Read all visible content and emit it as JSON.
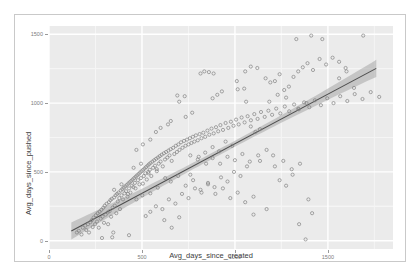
{
  "caption_ghost": "",
  "chart_data": {
    "type": "scatter",
    "title": "",
    "xlabel": "Avg_days_since_created",
    "ylabel": "Avg_days_since_pushed",
    "xlim": [
      0,
      1850
    ],
    "ylim": [
      -60,
      1560
    ],
    "xticks": [
      0,
      500,
      1000,
      1500
    ],
    "yticks": [
      0,
      500,
      1000,
      1500
    ],
    "xtick_labels": [
      "0",
      "500",
      "1000",
      "1500"
    ],
    "ytick_labels": [
      "0",
      "500",
      "1000",
      "1500"
    ],
    "grid": true,
    "legend": "none",
    "panel_background": "#ebebeb",
    "gridline_color": "#ffffff",
    "point_color": "#7f7f7f",
    "point_fill": "none",
    "point_shape": "open-circle",
    "point_size": 3.2,
    "fit": {
      "type": "linear-regression",
      "line_color": "#4d4d4d",
      "band_color": "#a6a6a6",
      "band_opacity": 0.55,
      "slope": 0.72,
      "intercept": -15,
      "x_start": 120,
      "x_end": 1760,
      "band_halfwidth_min": 22,
      "band_halfwidth_end": 62
    },
    "points": [
      [
        150,
        60
      ],
      [
        160,
        72
      ],
      [
        175,
        45
      ],
      [
        182,
        95
      ],
      [
        195,
        110
      ],
      [
        200,
        78
      ],
      [
        210,
        120
      ],
      [
        215,
        60
      ],
      [
        222,
        135
      ],
      [
        230,
        150
      ],
      [
        235,
        100
      ],
      [
        240,
        168
      ],
      [
        248,
        120
      ],
      [
        252,
        185
      ],
      [
        258,
        140
      ],
      [
        262,
        200
      ],
      [
        268,
        95
      ],
      [
        272,
        210
      ],
      [
        278,
        160
      ],
      [
        282,
        225
      ],
      [
        288,
        175
      ],
      [
        292,
        240
      ],
      [
        296,
        130
      ],
      [
        300,
        255
      ],
      [
        305,
        190
      ],
      [
        310,
        268
      ],
      [
        315,
        205
      ],
      [
        318,
        120
      ],
      [
        322,
        280
      ],
      [
        326,
        215
      ],
      [
        330,
        295
      ],
      [
        334,
        175
      ],
      [
        338,
        305
      ],
      [
        342,
        240
      ],
      [
        346,
        60
      ],
      [
        350,
        315
      ],
      [
        354,
        255
      ],
      [
        358,
        330
      ],
      [
        362,
        200
      ],
      [
        366,
        340
      ],
      [
        370,
        285
      ],
      [
        374,
        350
      ],
      [
        378,
        310
      ],
      [
        382,
        230
      ],
      [
        386,
        365
      ],
      [
        390,
        330
      ],
      [
        394,
        375
      ],
      [
        398,
        300
      ],
      [
        402,
        385
      ],
      [
        406,
        345
      ],
      [
        410,
        395
      ],
      [
        414,
        360
      ],
      [
        418,
        405
      ],
      [
        422,
        320
      ],
      [
        426,
        415
      ],
      [
        430,
        380
      ],
      [
        434,
        425
      ],
      [
        438,
        350
      ],
      [
        442,
        435
      ],
      [
        446,
        400
      ],
      [
        450,
        445
      ],
      [
        454,
        390
      ],
      [
        458,
        455
      ],
      [
        462,
        420
      ],
      [
        466,
        465
      ],
      [
        470,
        300
      ],
      [
        474,
        475
      ],
      [
        478,
        440
      ],
      [
        482,
        485
      ],
      [
        486,
        410
      ],
      [
        490,
        495
      ],
      [
        494,
        455
      ],
      [
        498,
        505
      ],
      [
        502,
        330
      ],
      [
        506,
        515
      ],
      [
        510,
        470
      ],
      [
        514,
        525
      ],
      [
        518,
        490
      ],
      [
        522,
        535
      ],
      [
        526,
        445
      ],
      [
        530,
        545
      ],
      [
        534,
        500
      ],
      [
        538,
        555
      ],
      [
        542,
        515
      ],
      [
        546,
        565
      ],
      [
        550,
        470
      ],
      [
        556,
        575
      ],
      [
        560,
        530
      ],
      [
        566,
        585
      ],
      [
        570,
        545
      ],
      [
        576,
        595
      ],
      [
        580,
        505
      ],
      [
        586,
        605
      ],
      [
        590,
        560
      ],
      [
        596,
        615
      ],
      [
        600,
        575
      ],
      [
        606,
        625
      ],
      [
        612,
        540
      ],
      [
        618,
        635
      ],
      [
        624,
        590
      ],
      [
        630,
        645
      ],
      [
        636,
        605
      ],
      [
        642,
        655
      ],
      [
        648,
        620
      ],
      [
        654,
        665
      ],
      [
        660,
        580
      ],
      [
        668,
        675
      ],
      [
        674,
        630
      ],
      [
        682,
        690
      ],
      [
        688,
        645
      ],
      [
        696,
        700
      ],
      [
        702,
        660
      ],
      [
        710,
        715
      ],
      [
        718,
        675
      ],
      [
        726,
        725
      ],
      [
        734,
        690
      ],
      [
        742,
        735
      ],
      [
        750,
        700
      ],
      [
        758,
        745
      ],
      [
        766,
        710
      ],
      [
        774,
        755
      ],
      [
        782,
        720
      ],
      [
        790,
        765
      ],
      [
        800,
        730
      ],
      [
        810,
        775
      ],
      [
        820,
        745
      ],
      [
        830,
        785
      ],
      [
        840,
        755
      ],
      [
        852,
        800
      ],
      [
        862,
        770
      ],
      [
        874,
        815
      ],
      [
        886,
        780
      ],
      [
        898,
        825
      ],
      [
        910,
        795
      ],
      [
        922,
        840
      ],
      [
        936,
        805
      ],
      [
        950,
        855
      ],
      [
        964,
        820
      ],
      [
        978,
        865
      ],
      [
        992,
        835
      ],
      [
        1006,
        880
      ],
      [
        1020,
        845
      ],
      [
        1036,
        895
      ],
      [
        1052,
        860
      ],
      [
        1068,
        905
      ],
      [
        1086,
        875
      ],
      [
        1104,
        920
      ],
      [
        1122,
        885
      ],
      [
        1140,
        935
      ],
      [
        1160,
        900
      ],
      [
        1180,
        945
      ],
      [
        1200,
        915
      ],
      [
        1222,
        960
      ],
      [
        1244,
        925
      ],
      [
        1268,
        975
      ],
      [
        1292,
        940
      ],
      [
        1318,
        990
      ],
      [
        1344,
        955
      ],
      [
        1372,
        1005
      ],
      [
        1400,
        970
      ],
      [
        1430,
        1020
      ],
      [
        1462,
        985
      ],
      [
        1496,
        1035
      ],
      [
        1530,
        1000
      ],
      [
        1566,
        1050
      ],
      [
        1604,
        1015
      ],
      [
        1644,
        1065
      ],
      [
        1686,
        1030
      ],
      [
        1730,
        1080
      ],
      [
        1776,
        1045
      ],
      [
        520,
        180
      ],
      [
        545,
        210
      ],
      [
        575,
        250
      ],
      [
        610,
        230
      ],
      [
        645,
        300
      ],
      [
        680,
        270
      ],
      [
        715,
        340
      ],
      [
        750,
        310
      ],
      [
        785,
        380
      ],
      [
        820,
        350
      ],
      [
        855,
        420
      ],
      [
        890,
        390
      ],
      [
        925,
        460
      ],
      [
        960,
        430
      ],
      [
        995,
        500
      ],
      [
        1030,
        470
      ],
      [
        1065,
        540
      ],
      [
        1100,
        190
      ],
      [
        1135,
        580
      ],
      [
        1170,
        230
      ],
      [
        1205,
        620
      ],
      [
        1240,
        440
      ],
      [
        1275,
        400
      ],
      [
        1310,
        480
      ],
      [
        1345,
        120
      ],
      [
        1380,
        10
      ],
      [
        1415,
        200
      ],
      [
        620,
        150
      ],
      [
        660,
        95
      ],
      [
        700,
        170
      ],
      [
        430,
        40
      ],
      [
        340,
        25
      ],
      [
        285,
        20
      ],
      [
        760,
        480
      ],
      [
        805,
        610
      ],
      [
        845,
        560
      ],
      [
        880,
        680
      ],
      [
        915,
        650
      ],
      [
        950,
        720
      ],
      [
        985,
        690
      ],
      [
        1015,
        1100
      ],
      [
        1050,
        1105
      ],
      [
        1060,
        1010
      ],
      [
        1085,
        830
      ],
      [
        1110,
        790
      ],
      [
        1135,
        810
      ],
      [
        1165,
        1180
      ],
      [
        1190,
        1150
      ],
      [
        1215,
        1160
      ],
      [
        1240,
        1210
      ],
      [
        1265,
        1095
      ],
      [
        1290,
        1120
      ],
      [
        1315,
        1190
      ],
      [
        1340,
        1230
      ],
      [
        1365,
        1260
      ],
      [
        1390,
        1290
      ],
      [
        1420,
        1240
      ],
      [
        1455,
        1320
      ],
      [
        1490,
        1280
      ],
      [
        1525,
        1330
      ],
      [
        1560,
        1300
      ],
      [
        1600,
        1230
      ],
      [
        1640,
        1110
      ],
      [
        1690,
        1490
      ],
      [
        1410,
        1490
      ],
      [
        1470,
        1465
      ],
      [
        1330,
        1465
      ],
      [
        1560,
        1180
      ],
      [
        1595,
        1255
      ],
      [
        700,
        1010
      ],
      [
        735,
        900
      ],
      [
        770,
        930
      ],
      [
        690,
        1055
      ],
      [
        730,
        1050
      ],
      [
        655,
        870
      ],
      [
        880,
        1035
      ],
      [
        905,
        1060
      ],
      [
        930,
        1085
      ],
      [
        860,
        1225
      ],
      [
        835,
        1230
      ],
      [
        815,
        1215
      ],
      [
        885,
        1215
      ],
      [
        1010,
        1160
      ],
      [
        1055,
        1230
      ],
      [
        1085,
        1265
      ],
      [
        1120,
        1255
      ],
      [
        1185,
        1010
      ],
      [
        1230,
        1060
      ],
      [
        1275,
        1040
      ],
      [
        1340,
        960
      ],
      [
        1385,
        1000
      ],
      [
        600,
        820
      ],
      [
        640,
        845
      ],
      [
        575,
        790
      ],
      [
        545,
        735
      ],
      [
        505,
        700
      ],
      [
        470,
        660
      ],
      [
        760,
        620
      ],
      [
        800,
        590
      ],
      [
        840,
        640
      ],
      [
        880,
        600
      ],
      [
        920,
        560
      ],
      [
        960,
        610
      ],
      [
        1000,
        585
      ],
      [
        1040,
        630
      ],
      [
        1080,
        575
      ],
      [
        1125,
        620
      ],
      [
        1170,
        660
      ],
      [
        1215,
        540
      ],
      [
        1260,
        580
      ],
      [
        1305,
        520
      ],
      [
        1350,
        560
      ],
      [
        1395,
        300
      ],
      [
        655,
        430
      ],
      [
        695,
        470
      ],
      [
        735,
        400
      ],
      [
        775,
        440
      ],
      [
        815,
        370
      ],
      [
        855,
        410
      ],
      [
        895,
        340
      ],
      [
        935,
        380
      ],
      [
        975,
        310
      ],
      [
        1015,
        350
      ],
      [
        1055,
        280
      ],
      [
        1100,
        320
      ],
      [
        455,
        530
      ],
      [
        495,
        560
      ],
      [
        535,
        490
      ],
      [
        580,
        520
      ],
      [
        625,
        455
      ],
      [
        350,
        370
      ],
      [
        390,
        410
      ],
      [
        425,
        340
      ],
      [
        465,
        380
      ],
      [
        505,
        415
      ],
      [
        545,
        345
      ],
      [
        585,
        385
      ]
    ]
  }
}
